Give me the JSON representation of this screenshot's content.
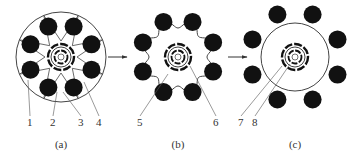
{
  "figure": {
    "panels": [
      {
        "id": "a",
        "caption": "(a)",
        "center": [
          61,
          57
        ],
        "outline": "circle",
        "outline_radius": 45,
        "dot_radius": 9,
        "dot_orbit": 33,
        "callouts": [
          {
            "label": "1",
            "x": 27,
            "y": 126,
            "tx": 28,
            "ty": 80
          },
          {
            "label": "2",
            "x": 50,
            "y": 126,
            "tx": 57,
            "ty": 92
          },
          {
            "label": "3",
            "x": 78,
            "y": 126,
            "tx": 63,
            "ty": 92
          },
          {
            "label": "4",
            "x": 96,
            "y": 126,
            "tx": 84,
            "ty": 82
          }
        ]
      },
      {
        "id": "b",
        "caption": "(b)",
        "center": [
          178,
          57
        ],
        "outline": "lobed",
        "outline_radius": 38,
        "dot_radius": 9,
        "dot_orbit": 38,
        "callouts": [
          {
            "label": "5",
            "x": 137,
            "y": 126,
            "tx": 168,
            "ty": 74
          },
          {
            "label": "6",
            "x": 213,
            "y": 126,
            "tx": 190,
            "ty": 66
          }
        ]
      },
      {
        "id": "c",
        "caption": "(c)",
        "center": [
          295,
          57
        ],
        "outline": "circle",
        "outline_radius": 34,
        "dot_radius": 9,
        "dot_orbit": 46,
        "callouts": [
          {
            "label": "7",
            "x": 238,
            "y": 126,
            "tx": 282,
            "ty": 66
          },
          {
            "label": "8",
            "x": 252,
            "y": 126,
            "tx": 290,
            "ty": 64
          }
        ]
      }
    ],
    "arrows": [
      {
        "from": [
          108,
          57
        ],
        "to": [
          127,
          57
        ]
      },
      {
        "from": [
          228,
          57
        ],
        "to": [
          247,
          57
        ]
      }
    ],
    "colors": {
      "ink": "#111111",
      "line": "#444444",
      "background": "#ffffff"
    }
  }
}
